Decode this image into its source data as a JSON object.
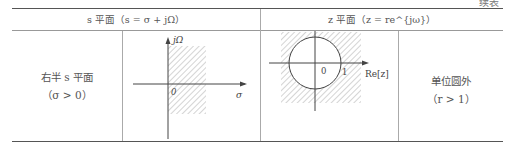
{
  "continuation_label": "续表",
  "table": {
    "headers": [
      {
        "text": "s 平面（s = σ + jΩ）"
      },
      {
        "text": "z 平面（z = re^{jω}）"
      }
    ],
    "rows": [
      {
        "s_region": {
          "line1": "右半 s 平面",
          "line2": "（σ > 0）"
        },
        "s_figure": {
          "axis_y": "jΩ",
          "axis_x": "σ",
          "origin": "0"
        },
        "z_figure": {
          "axis_y": "Im[z]",
          "axis_x": "Re[z]",
          "origin": "0",
          "unit": "1"
        },
        "z_region": {
          "line1": "单位圆外",
          "line2": "（r > 1）"
        }
      }
    ]
  }
}
